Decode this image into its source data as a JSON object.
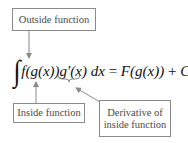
{
  "diagram": {
    "labels": {
      "outside": "Outside function",
      "inside": "Inside function",
      "derivative_line1": "Derivative of",
      "derivative_line2": "inside function"
    },
    "formula": {
      "integral": "∫",
      "integrand_f": "f(g(x))",
      "integrand_gprime": "g′(x)",
      "dx": " dx",
      "equals": " = ",
      "rhs_F": "F(g(x))",
      "plus": " + ",
      "constant": "C"
    },
    "colors": {
      "box_border": "#8a8a8a",
      "label_text": "#4a4a4a",
      "arrow": "#8a8a8a",
      "formula_text": "#111111"
    }
  }
}
